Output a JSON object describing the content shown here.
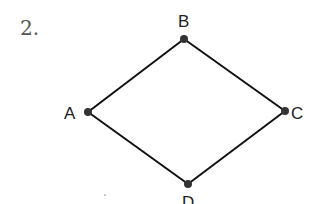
{
  "problem_number": "2.",
  "diagram": {
    "type": "quadrilateral",
    "vertices": [
      {
        "name": "A",
        "label": "A",
        "x": 88,
        "y": 112
      },
      {
        "name": "B",
        "label": "B",
        "x": 184,
        "y": 39
      },
      {
        "name": "C",
        "label": "C",
        "x": 285,
        "y": 111
      },
      {
        "name": "D",
        "label": "D",
        "x": 188,
        "y": 184
      }
    ],
    "edges": [
      [
        "A",
        "B"
      ],
      [
        "B",
        "C"
      ],
      [
        "C",
        "D"
      ],
      [
        "D",
        "A"
      ]
    ],
    "line_color": "#111111",
    "point_color": "#333333"
  }
}
